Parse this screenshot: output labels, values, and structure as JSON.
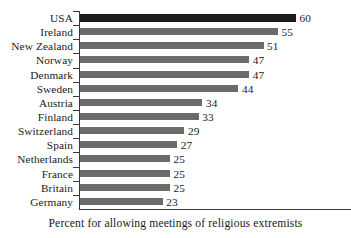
{
  "chart_data": {
    "type": "bar",
    "orientation": "horizontal",
    "title": "",
    "xlabel": "Percent for allowing meetings of religious extremists",
    "ylabel": "",
    "categories": [
      "USA",
      "Ireland",
      "New Zealand",
      "Norway",
      "Denmark",
      "Sweden",
      "Austria",
      "Finland",
      "Switzerland",
      "Spain",
      "Netherlands",
      "France",
      "Britain",
      "Germany"
    ],
    "values": [
      60,
      55,
      51,
      47,
      47,
      44,
      34,
      33,
      29,
      27,
      25,
      25,
      25,
      23
    ],
    "value_labels": [
      "60",
      "55",
      "51",
      "47",
      "47",
      "44",
      "34",
      "33",
      "29",
      "27",
      "25",
      "25",
      "25",
      "23"
    ],
    "highlighted_category": "USA",
    "xlim": [
      0,
      60
    ],
    "grid": false,
    "legend": null,
    "colors": {
      "bar": "#6b6b6b",
      "bar_highlight": "#1c1c1c",
      "axis": "#3a3a3a",
      "text": "#1a1a1a",
      "background": "#ffffff"
    }
  },
  "caption": {
    "text": "Percent for allowing meetings of religious extremists"
  }
}
